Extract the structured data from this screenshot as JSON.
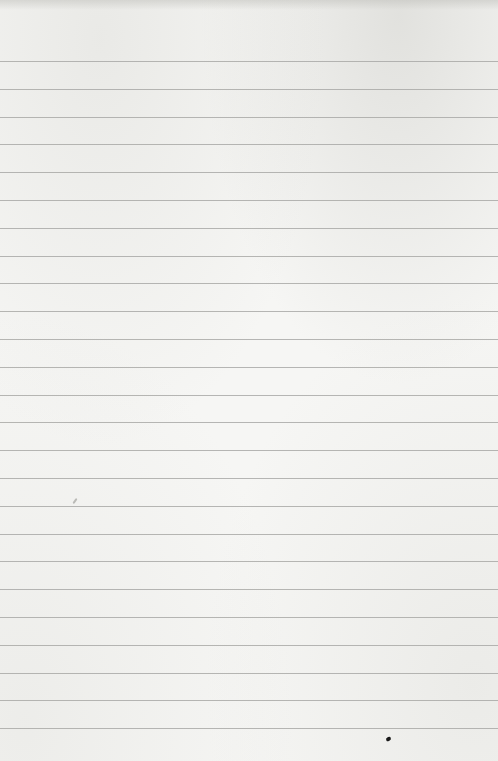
{
  "page": {
    "type": "blank-lined-paper",
    "background_color": "#f6f6f4",
    "rule_color": "#a9a9a7",
    "rule_count": 25,
    "first_rule_y": 61,
    "rule_spacing": 27.8,
    "text_content": ""
  },
  "marks": [
    {
      "kind": "ink-speck",
      "x": 386,
      "y": 737,
      "color": "#1a1a1a"
    },
    {
      "kind": "faint-smudge",
      "x": 72,
      "y": 500,
      "color": "#969691"
    }
  ]
}
